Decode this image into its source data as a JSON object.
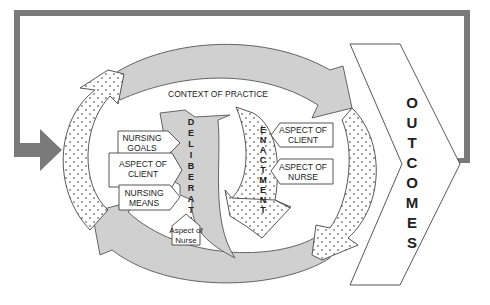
{
  "diagram": {
    "context_label": "CONTEXT OF PRACTICE",
    "deliberation": {
      "word": "DELIBERATION",
      "letters": [
        "D",
        "E",
        "L",
        "I",
        "B",
        "E",
        "R",
        "A",
        "T",
        "I",
        "O",
        "N"
      ],
      "inputs": [
        {
          "line1": "NURSING",
          "line2": "GOALS"
        },
        {
          "line1": "ASPECT OF",
          "line2": "CLIENT"
        },
        {
          "line1": "NURSING",
          "line2": "MEANS"
        },
        {
          "line1": "Aspect of",
          "line2": "Nurse"
        }
      ]
    },
    "enactment": {
      "word": "ENACTMENT",
      "letters": [
        "E",
        "N",
        "A",
        "C",
        "T",
        "M",
        "E",
        "N",
        "T"
      ],
      "inputs": [
        {
          "line1": "ASPECT OF",
          "line2": "CLIENT"
        },
        {
          "line1": "ASPECT OF",
          "line2": "NURSE"
        }
      ]
    },
    "outcomes": {
      "word": "OUTCOMES",
      "letters": [
        "O",
        "U",
        "T",
        "C",
        "O",
        "M",
        "E",
        "S"
      ]
    },
    "colors": {
      "feedback_arrow": "#7a7a7a",
      "gray_arc": "#d0d0d0",
      "outline": "#444444",
      "background": "#ffffff"
    }
  }
}
